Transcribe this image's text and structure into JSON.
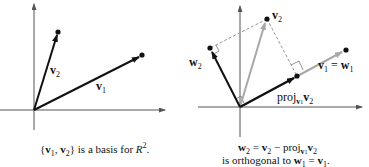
{
  "left_figure": {
    "labels": {
      "v1": {
        "base": "v",
        "sub": "1"
      },
      "v2": {
        "base": "v",
        "sub": "2"
      }
    },
    "caption": {
      "open": "{",
      "v1": "v",
      "v1_sub": "1",
      "comma": ", ",
      "v2": "v",
      "v2_sub": "2",
      "close": "}",
      "text": " is a basis for ",
      "space": "R",
      "space_sup": "2",
      "end": "."
    }
  },
  "right_figure": {
    "labels": {
      "v2": {
        "base": "v",
        "sub": "2"
      },
      "w2": {
        "base": "w",
        "sub": "2"
      },
      "v1_eq_w1": {
        "v": "v",
        "v_sub": "1",
        "eq": " = ",
        "w": "w",
        "w_sub": "1"
      },
      "proj": {
        "text": "proj",
        "sub_v": "v",
        "sub_v_sub": "1",
        "v": "v",
        "v_sub": "2"
      }
    },
    "caption": {
      "line1": {
        "w": "w",
        "w_sub": "2",
        "eq": " = ",
        "v": "v",
        "v_sub": "2",
        "minus": " − proj",
        "pv": "v",
        "pv_sub": "1",
        "v2": "v",
        "v2_sub": "2"
      },
      "line2": {
        "text": "is orthogonal to ",
        "w": "w",
        "w_sub": "1",
        "eq": " = ",
        "v": "v",
        "v_sub": "1",
        "end": "."
      }
    }
  },
  "colors": {
    "black_vector": "#111111",
    "gray_vector": "#a8a8a8",
    "axis": "#555555",
    "dashed": "#999999"
  }
}
